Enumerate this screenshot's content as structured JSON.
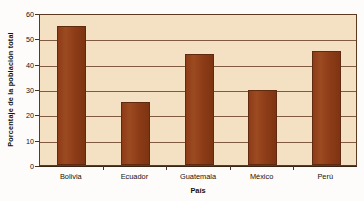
{
  "chart_data": {
    "type": "bar",
    "title": "",
    "subtitle": "",
    "categories": [
      "Bolivia",
      "Ecuador",
      "Guatemala",
      "México",
      "Perú"
    ],
    "values": [
      55,
      25,
      44,
      29.5,
      45
    ],
    "series": [
      {
        "name": "Porcentaje de la población total",
        "values": [
          55,
          25,
          44,
          29.5,
          45
        ]
      }
    ],
    "xlabel": "País",
    "ylabel": "Porcentaje de la población total",
    "ylim": [
      0,
      60
    ],
    "yticks": [
      0,
      10,
      20,
      30,
      40,
      50,
      60
    ],
    "ytick_labels": [
      "0",
      "10",
      "20",
      "30",
      "40",
      "50",
      "60"
    ],
    "xtick_labels": [
      "Bolivia",
      "Ecuador",
      "Guatemala",
      "México",
      "Perú"
    ],
    "grid": true,
    "grid_axis": "y",
    "legend": false,
    "legend_position": "none",
    "annotations": [],
    "colors": {
      "bar_fill": "#8e3c18",
      "bar_edge": "#5f2a10",
      "plot_background": "#f4e0c2",
      "gridline": "#6b432a",
      "axis_line": "#3a2414",
      "text": "#17110c",
      "figure_background": "#fdfcfa"
    }
  }
}
